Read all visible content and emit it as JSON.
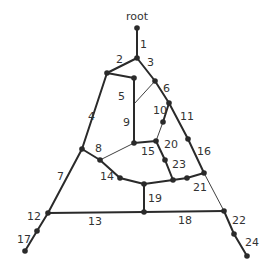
{
  "title": "root",
  "edges": [
    {
      "id": "1",
      "label": "1"
    },
    {
      "id": "2",
      "label": "2"
    },
    {
      "id": "3",
      "label": "3"
    },
    {
      "id": "4",
      "label": "4"
    },
    {
      "id": "5",
      "label": "5"
    },
    {
      "id": "6",
      "label": "6"
    },
    {
      "id": "7",
      "label": "7"
    },
    {
      "id": "8",
      "label": "8"
    },
    {
      "id": "9",
      "label": "9"
    },
    {
      "id": "10",
      "label": "10"
    },
    {
      "id": "11",
      "label": "11"
    },
    {
      "id": "12",
      "label": "12"
    },
    {
      "id": "13",
      "label": "13"
    },
    {
      "id": "14",
      "label": "14"
    },
    {
      "id": "15",
      "label": "15"
    },
    {
      "id": "16",
      "label": "16"
    },
    {
      "id": "17",
      "label": "17"
    },
    {
      "id": "18",
      "label": "18"
    },
    {
      "id": "19",
      "label": "19"
    },
    {
      "id": "20",
      "label": "20"
    },
    {
      "id": "21",
      "label": "21"
    },
    {
      "id": "22",
      "label": "22"
    },
    {
      "id": "23",
      "label": "23"
    },
    {
      "id": "24",
      "label": "24"
    }
  ],
  "colors": {
    "line": "#2a2a2a",
    "text": "#333333",
    "background": "#ffffff"
  }
}
